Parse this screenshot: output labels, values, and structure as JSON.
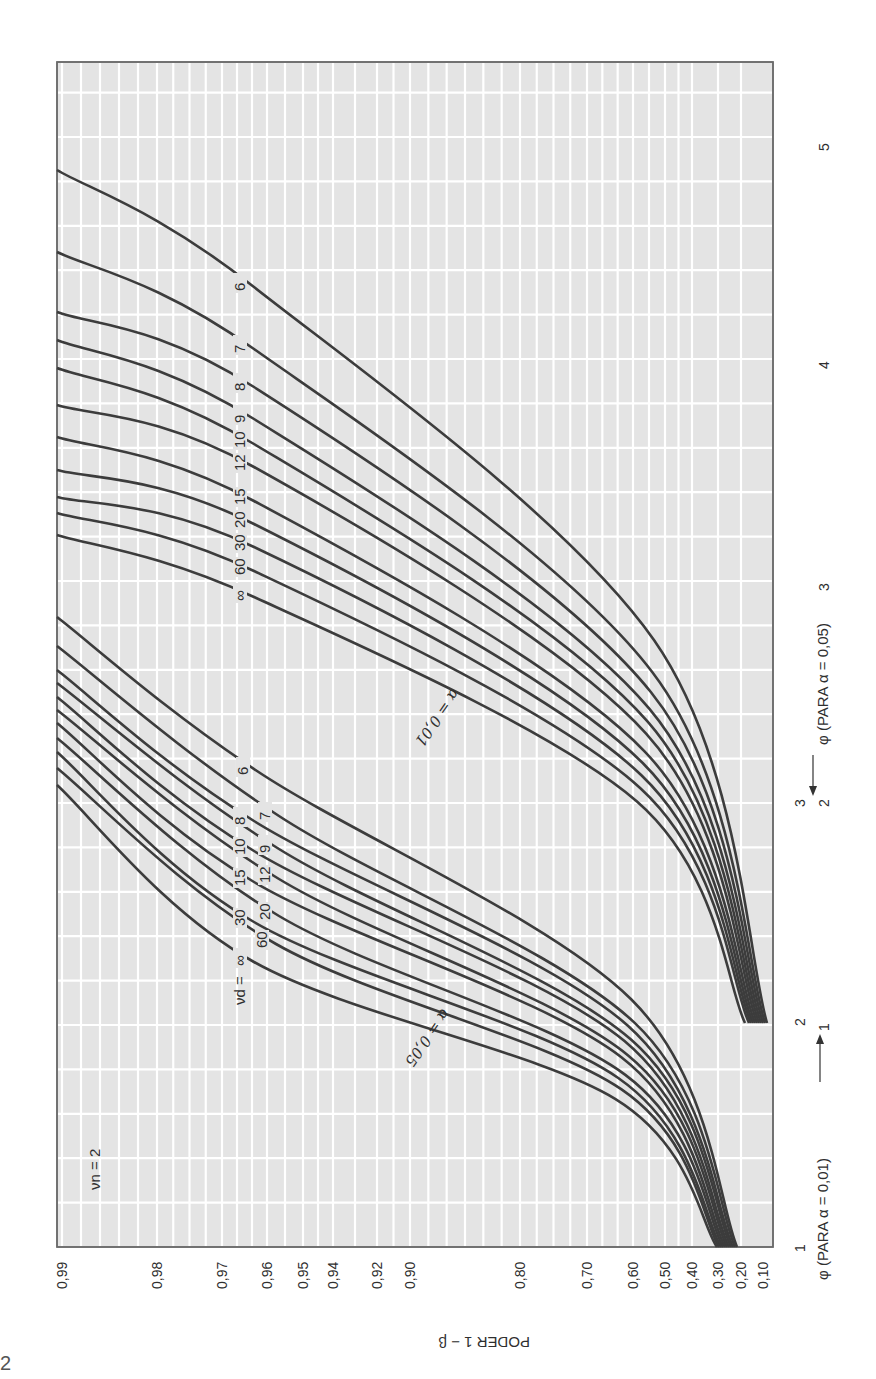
{
  "page": {
    "number": "2"
  },
  "chart_data": {
    "type": "line",
    "orientation_note_visible": false,
    "title": "",
    "panel_label": "ν_n = 2",
    "xlabel_alpha005": "φ (PARA α = 0,05)",
    "xlabel_alpha001": "φ (PARA α = 0,01)",
    "ylabel": "PODER 1 − β",
    "y_ticks": [
      "0,99",
      "0,98",
      "0,97",
      "0,96",
      "0,95",
      "0,94",
      "0,92",
      "0,90",
      "0,80",
      "0,70",
      "0,60",
      "0,50",
      "0,40",
      "0,30",
      "0,20",
      "0,10"
    ],
    "y_tick_values": [
      0.99,
      0.98,
      0.97,
      0.96,
      0.95,
      0.94,
      0.92,
      0.9,
      0.8,
      0.7,
      0.6,
      0.5,
      0.4,
      0.3,
      0.2,
      0.1
    ],
    "y_tick_pixel_x": [
      62,
      157,
      222,
      267,
      303,
      333,
      377,
      410,
      520,
      587,
      633,
      665,
      692,
      718,
      741,
      763
    ],
    "x_ticks_alpha001": [
      {
        "label": "1",
        "px_y": 1248
      },
      {
        "label": "2",
        "px_y": 1022
      },
      {
        "label": "3",
        "px_y": 803
      }
    ],
    "x_ticks_alpha005": [
      {
        "label": "1",
        "px_y": 1027
      },
      {
        "label": "2",
        "px_y": 803
      },
      {
        "label": "3",
        "px_y": 587
      },
      {
        "label": "4",
        "px_y": 365
      },
      {
        "label": "5",
        "px_y": 147
      }
    ],
    "frame": {
      "left": 57,
      "top": 62,
      "right": 773,
      "bottom": 1247
    },
    "grid": true,
    "legend_position": "inline labels on curves",
    "families": [
      {
        "name": "α = 0,05",
        "alpha": 0.05,
        "family_label": "α = 0,05",
        "family_label_pos": [
          455,
          1045
        ],
        "curves": [
          {
            "nu_d": "6",
            "start": [
              737,
              1247
            ],
            "label": [
              243,
              767
            ],
            "end": [
              57,
              617
            ]
          },
          {
            "nu_d": "7",
            "start": [
              735,
              1247
            ],
            "label": [
              265,
              812
            ],
            "end": [
              57,
              646
            ]
          },
          {
            "nu_d": "8",
            "start": [
              733,
              1247
            ],
            "label": [
              240,
              817
            ],
            "end": [
              57,
              670
            ]
          },
          {
            "nu_d": "9",
            "start": [
              731,
              1247
            ],
            "label": [
              265,
              845
            ],
            "end": [
              57,
              683
            ]
          },
          {
            "nu_d": "10",
            "start": [
              729,
              1247
            ],
            "label": [
              240,
              847
            ],
            "end": [
              57,
              697
            ]
          },
          {
            "nu_d": "12",
            "start": [
              727,
              1247
            ],
            "label": [
              265,
              875
            ],
            "end": [
              57,
              710
            ]
          },
          {
            "nu_d": "15",
            "start": [
              725,
              1247
            ],
            "label": [
              240,
              878
            ],
            "end": [
              57,
              723
            ]
          },
          {
            "nu_d": "20",
            "start": [
              723,
              1247
            ],
            "label": [
              265,
              912
            ],
            "end": [
              57,
              738
            ]
          },
          {
            "nu_d": "30",
            "start": [
              721,
              1247
            ],
            "label": [
              240,
              918
            ],
            "end": [
              57,
              752
            ]
          },
          {
            "nu_d": "60",
            "start": [
              719,
              1247
            ],
            "label": [
              262,
              940
            ],
            "end": [
              57,
              768
            ]
          },
          {
            "nu_d": "∞",
            "start": [
              717,
              1247
            ],
            "label": [
              240,
              958
            ],
            "end": [
              57,
              785
            ]
          }
        ]
      },
      {
        "name": "α = 0,01",
        "alpha": 0.01,
        "family_label": "α = 0,01",
        "family_label_pos": [
          470,
          722
        ],
        "curves": [
          {
            "nu_d": "6",
            "start": [
              767,
              1023
            ],
            "label": [
              240,
              283
            ],
            "end": [
              57,
              170
            ]
          },
          {
            "nu_d": "7",
            "start": [
              765,
              1023
            ],
            "label": [
              240,
              345
            ],
            "end": [
              57,
              252
            ]
          },
          {
            "nu_d": "8",
            "start": [
              763,
              1023
            ],
            "label": [
              240,
              383
            ],
            "end": [
              57,
              312
            ]
          },
          {
            "nu_d": "9",
            "start": [
              761,
              1023
            ],
            "label": [
              240,
              415
            ],
            "end": [
              57,
              340
            ]
          },
          {
            "nu_d": "10",
            "start": [
              759,
              1023
            ],
            "label": [
              240,
              440
            ],
            "end": [
              57,
              368
            ]
          },
          {
            "nu_d": "12",
            "start": [
              757,
              1023
            ],
            "label": [
              240,
              463
            ],
            "end": [
              57,
              405
            ]
          },
          {
            "nu_d": "15",
            "start": [
              755,
              1023
            ],
            "label": [
              240,
              497
            ],
            "end": [
              57,
              437
            ]
          },
          {
            "nu_d": "20",
            "start": [
              753,
              1023
            ],
            "label": [
              240,
              520
            ],
            "end": [
              57,
              470
            ]
          },
          {
            "nu_d": "30",
            "start": [
              751,
              1023
            ],
            "label": [
              240,
              543
            ],
            "end": [
              57,
              497
            ]
          },
          {
            "nu_d": "60",
            "start": [
              749,
              1023
            ],
            "label": [
              240,
              567
            ],
            "end": [
              57,
              513
            ]
          },
          {
            "nu_d": "∞",
            "start": [
              745,
              1023
            ],
            "label": [
              240,
              593
            ],
            "end": [
              57,
              535
            ]
          }
        ]
      }
    ],
    "nu_d_prefix_label": "ν_d =",
    "nu_d_prefix_pos": [
      240,
      975
    ]
  },
  "labels": {
    "panel": "νn = 2",
    "nu_d_prefix": "νd =",
    "alpha005_family": "α = 0,05",
    "alpha001_family": "α = 0,01",
    "ylabel": "PODER 1 − β",
    "phi_alpha005": "φ (PARA α = 0,05)",
    "phi_alpha001": "φ (PARA α = 0,01)"
  }
}
